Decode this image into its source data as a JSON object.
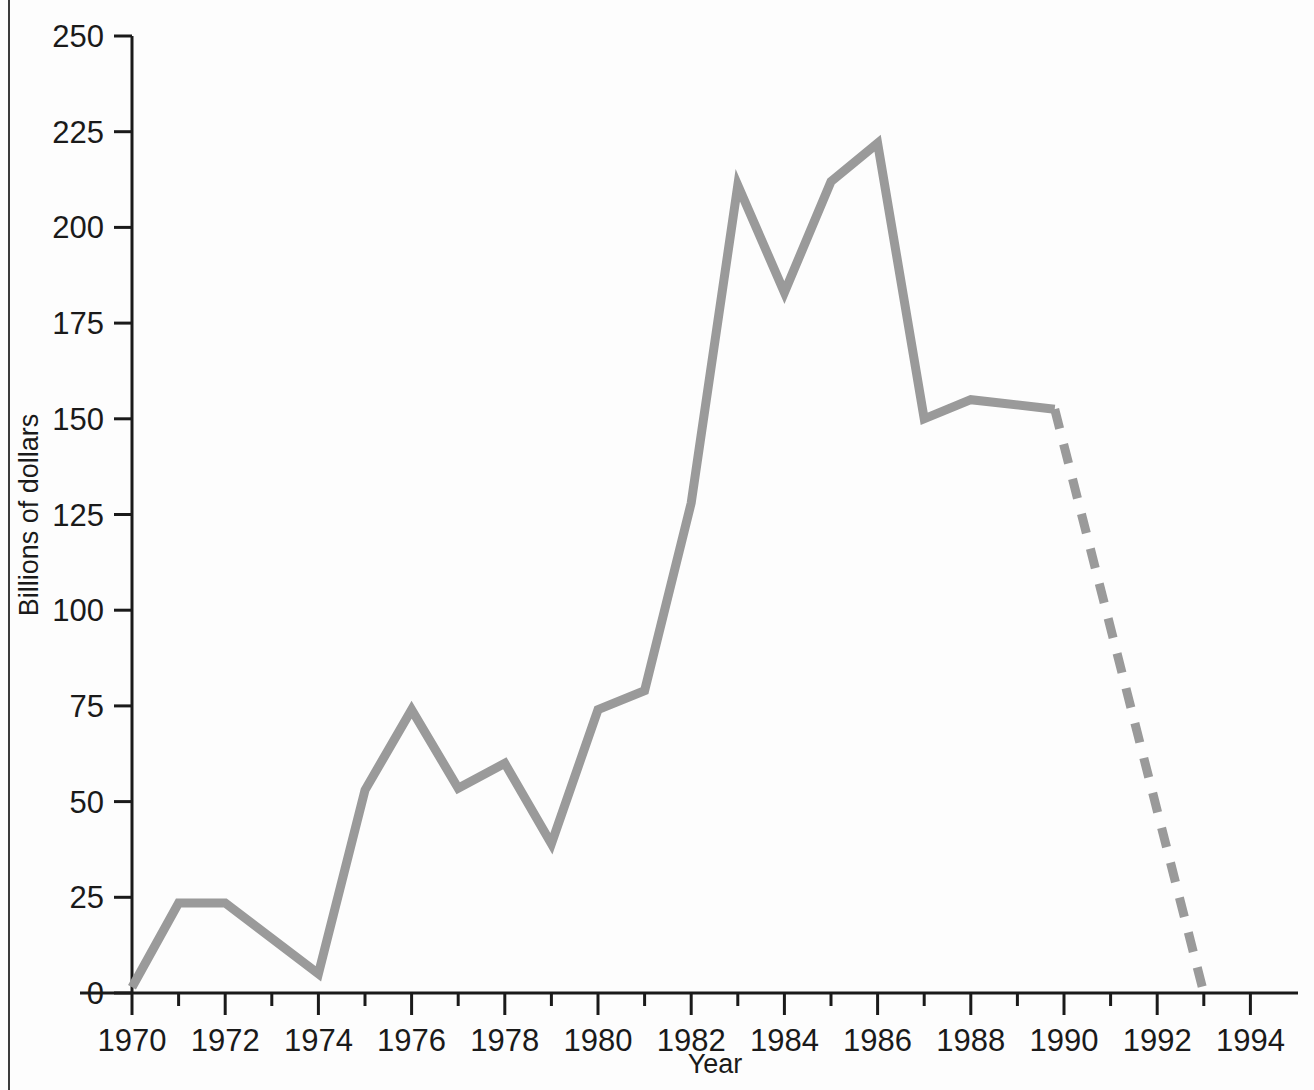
{
  "chart_data": {
    "type": "line",
    "title": "",
    "xlabel": "Year",
    "ylabel": "Billions of dollars",
    "xlim": [
      1969,
      1995
    ],
    "ylim": [
      0,
      250
    ],
    "grid": false,
    "legend": "none",
    "x_tick_labels": [
      "1970",
      "1972",
      "1974",
      "1976",
      "1978",
      "1980",
      "1982",
      "1984",
      "1986",
      "1988",
      "1990",
      "1992",
      "1994"
    ],
    "x_tick_values": [
      1970,
      1972,
      1974,
      1976,
      1978,
      1980,
      1982,
      1984,
      1986,
      1988,
      1990,
      1992,
      1994
    ],
    "x_minor_tick_values": [
      1971,
      1973,
      1975,
      1977,
      1979,
      1981,
      1983,
      1985,
      1987,
      1989,
      1991,
      1993
    ],
    "y_tick_labels": [
      "0",
      "25",
      "50",
      "75",
      "100",
      "125",
      "150",
      "175",
      "200",
      "225",
      "250"
    ],
    "y_tick_values": [
      0,
      25,
      50,
      75,
      100,
      125,
      150,
      175,
      200,
      225,
      250
    ],
    "line_color": "#9a9a9a",
    "axis_color": "#1a1a1a",
    "series": [
      {
        "name": "actual",
        "style": "solid",
        "x": [
          1970,
          1971,
          1972,
          1974,
          1975,
          1976,
          1977,
          1978,
          1979,
          1980,
          1981,
          1982,
          1983,
          1984,
          1985,
          1986,
          1987,
          1988,
          1989.8
        ],
        "values": [
          1.5,
          23.5,
          23.5,
          5,
          53,
          74,
          53.5,
          60,
          39,
          74,
          79,
          128,
          211,
          183,
          212,
          222,
          150,
          155,
          152.5
        ]
      },
      {
        "name": "projected",
        "style": "dashed",
        "x": [
          1989.8,
          1993
        ],
        "values": [
          152.5,
          0
        ]
      }
    ]
  },
  "axes": {
    "y_axis_title": "Billions of dollars",
    "x_axis_title": "Year"
  }
}
